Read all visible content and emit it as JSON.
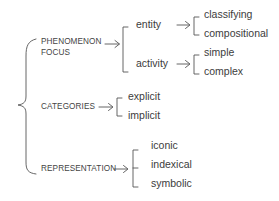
{
  "diagram": {
    "type": "tree",
    "root": {
      "children": [
        {
          "label_lines": [
            "PHENOMENON",
            "FOCUS"
          ],
          "children": [
            {
              "label": "entity",
              "children": [
                {
                  "label": "classifying"
                },
                {
                  "label": "compositional"
                }
              ]
            },
            {
              "label": "activity",
              "children": [
                {
                  "label": "simple"
                },
                {
                  "label": "complex"
                }
              ]
            }
          ]
        },
        {
          "label": "CATEGORIES",
          "children": [
            {
              "label": "explicit"
            },
            {
              "label": "implicit"
            }
          ]
        },
        {
          "label": "REPRESENTATION",
          "children": [
            {
              "label": "iconic"
            },
            {
              "label": "indexical"
            },
            {
              "label": "symbolic"
            }
          ]
        }
      ]
    },
    "colors": {
      "line": "#555555",
      "text": "#3a3a3a",
      "background": "#ffffff"
    }
  }
}
